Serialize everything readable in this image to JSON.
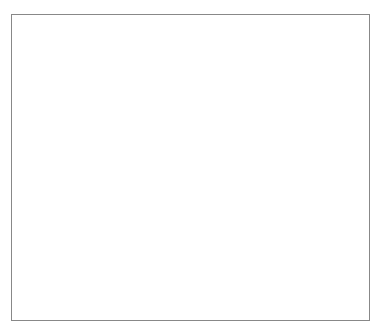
{
  "chart_data": {
    "type": "bar",
    "subtype": "population-pyramid (stacked horizontal, mirrored)",
    "title": "",
    "side_labels": {
      "left": "MALE",
      "right": "FEMALE"
    },
    "ylabel": "E.E.O. CLASSIFICATION IN 1982",
    "xlabel": "",
    "categories": [
      "SERVICE",
      "OPERTIVS",
      "CLERICAL",
      "TECH",
      "PROF",
      "OFF-MGR"
    ],
    "xticks": [
      "60000",
      "50000",
      "40000",
      "30000",
      "20000",
      "10000",
      "0",
      "10000",
      "20000",
      "30000",
      "40000",
      "50000",
      "60000"
    ],
    "xlim": [
      -60000,
      60000
    ],
    "legend": {
      "title": "Legend",
      "position": "right",
      "entries": [
        "Mean of SALARY82",
        "Mean of BONUS82",
        "Mean of BEN82"
      ]
    },
    "series_cumulative_note": "values are cumulative extents (salary, salary+bonus, salary+bonus+benefits)",
    "male": {
      "salary": [
        11000,
        16000,
        12500,
        18000,
        35500,
        34000
      ],
      "bonus": [
        11000,
        16500,
        12500,
        20000,
        41000,
        38000
      ],
      "total": [
        14000,
        21000,
        13500,
        23500,
        49500,
        47000
      ]
    },
    "female": {
      "salary": [
        0,
        0,
        13500,
        16000,
        21500,
        25000
      ],
      "bonus": [
        0,
        0,
        14500,
        18000,
        23500,
        28500
      ],
      "total": [
        0,
        0,
        16500,
        20500,
        28500,
        34500
      ]
    }
  }
}
